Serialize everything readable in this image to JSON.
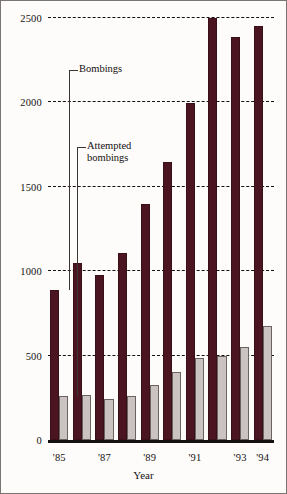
{
  "chart_data": {
    "type": "bar",
    "title": "",
    "xlabel": "Year",
    "ylabel": "",
    "ylim": [
      0,
      2500
    ],
    "yticks": [
      0,
      500,
      1000,
      1500,
      2000,
      2500
    ],
    "ytick_labels": [
      "0",
      "500",
      "1000",
      "1500",
      "2000",
      "2500"
    ],
    "grid": true,
    "legend_position": "inline-annotations",
    "categories": [
      "'85",
      "'86",
      "'87",
      "'88",
      "'89",
      "'90",
      "'91",
      "'92",
      "'93",
      "'94"
    ],
    "xtick_labels_shown": [
      "'85",
      "'87",
      "'89",
      "'91",
      "'93",
      "'94"
    ],
    "series": [
      {
        "name": "Bombings",
        "color": "#4a1520",
        "values": [
          890,
          1050,
          980,
          1110,
          1400,
          1650,
          2000,
          2500,
          2390,
          2450
        ]
      },
      {
        "name": "Attempted bombings",
        "color": "#cbc3c1",
        "values": [
          265,
          270,
          245,
          265,
          330,
          405,
          490,
          500,
          555,
          680
        ]
      }
    ],
    "annotations": [
      {
        "label": "Bombings",
        "target_series": "Bombings",
        "target_category": "'85"
      },
      {
        "label": "Attempted\nbombings",
        "label_line1": "Attempted",
        "label_line2": "bombings",
        "target_series": "Attempted bombings",
        "target_category": "'85"
      }
    ]
  },
  "annotation_text": {
    "bombings": "Bombings",
    "attempted_line1": "Attempted",
    "attempted_line2": "bombings"
  },
  "axis": {
    "x_title": "Year"
  }
}
